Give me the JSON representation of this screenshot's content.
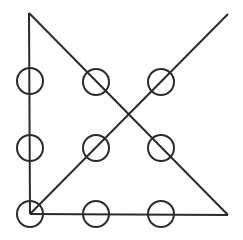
{
  "figure": {
    "canvas": {
      "width": 243,
      "height": 240,
      "background": "#ffffff"
    },
    "style": {
      "stroke_color": "#2b2b2b",
      "stroke_width": 2,
      "circle_radius": 13,
      "circle_fill": "none"
    },
    "points": {
      "apex_top_left": {
        "x": 29,
        "y": 13
      },
      "corner_bottom_left": {
        "x": 30,
        "y": 214
      },
      "corner_bottom_right": {
        "x": 228,
        "y": 215
      },
      "end_top_right": {
        "x": 228,
        "y": 14
      },
      "diagonal_crossing": {
        "x": 129,
        "y": 113
      }
    },
    "lines": [
      {
        "name": "left-vertical-line",
        "x1": 29,
        "y1": 13,
        "x2": 30,
        "y2": 214
      },
      {
        "name": "bottom-horizontal-line",
        "x1": 30,
        "y1": 214,
        "x2": 228,
        "y2": 215
      },
      {
        "name": "descending-diagonal-line",
        "x1": 29,
        "y1": 13,
        "x2": 228,
        "y2": 215
      },
      {
        "name": "ascending-diagonal-line",
        "x1": 30,
        "y1": 214,
        "x2": 228,
        "y2": 14
      }
    ],
    "circles": [
      {
        "name": "circle-top-left",
        "cx": 30,
        "cy": 81,
        "r": 13,
        "on": "left-vertical-line"
      },
      {
        "name": "circle-top-middle",
        "cx": 96,
        "cy": 82,
        "r": 13,
        "on": "descending-diagonal-line"
      },
      {
        "name": "circle-top-right",
        "cx": 161,
        "cy": 82,
        "r": 13,
        "on": "ascending-diagonal-line"
      },
      {
        "name": "circle-middle-left",
        "cx": 30,
        "cy": 148,
        "r": 13,
        "on": "left-vertical-line"
      },
      {
        "name": "circle-middle-center",
        "cx": 96,
        "cy": 148,
        "r": 13,
        "on": "ascending-diagonal-line"
      },
      {
        "name": "circle-middle-right",
        "cx": 161,
        "cy": 148,
        "r": 13,
        "on": "descending-diagonal-line"
      },
      {
        "name": "circle-bottom-left",
        "cx": 30,
        "cy": 214,
        "r": 13,
        "on": "corner-bottom-left"
      },
      {
        "name": "circle-bottom-middle",
        "cx": 96,
        "cy": 214,
        "r": 13,
        "on": "bottom-horizontal-line"
      },
      {
        "name": "circle-bottom-right",
        "cx": 161,
        "cy": 214,
        "r": 13,
        "on": "bottom-horizontal-line"
      }
    ],
    "circle_count": 9,
    "line_count": 4
  }
}
